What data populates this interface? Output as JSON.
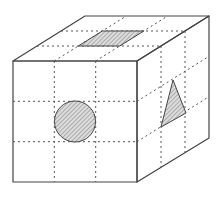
{
  "diagram": {
    "type": "cube-with-grid",
    "grid_divisions": 3,
    "colors": {
      "background": "#ffffff",
      "edge": "#444444",
      "grid": "#555555",
      "hatch_fill": "#d9d9d9",
      "hatch_line": "#777777"
    },
    "faces": {
      "front": {
        "marked_shape": "circle",
        "cell": "center"
      },
      "top": {
        "marked_shape": "parallelogram",
        "cell": "center"
      },
      "right": {
        "marked_shape": "triangle",
        "cell": "center"
      }
    }
  }
}
